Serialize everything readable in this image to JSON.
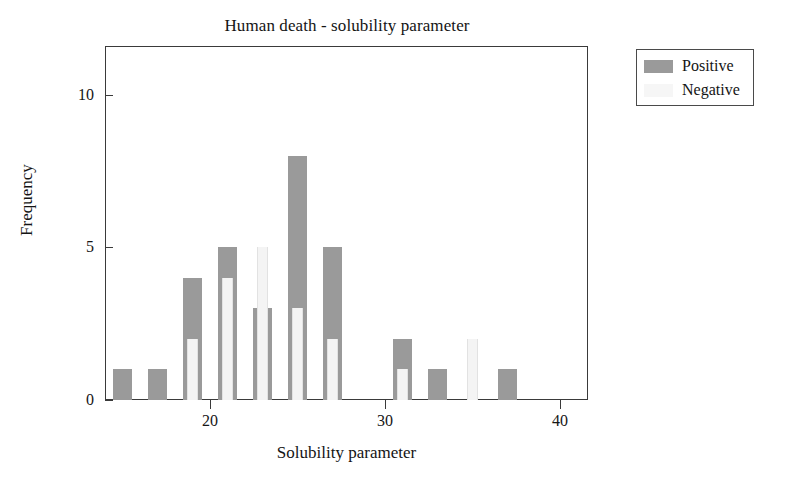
{
  "chart_data": {
    "type": "bar",
    "title": "Human death - solubility parameter",
    "xlabel": "Solubility parameter",
    "ylabel": "Frequency",
    "xlim": [
      14,
      41.6
    ],
    "ylim": [
      0,
      11.6
    ],
    "xticks": [
      20,
      30,
      40
    ],
    "xtick_labels": [
      "20",
      "30",
      "40"
    ],
    "yticks": [
      0,
      5,
      10
    ],
    "ytick_labels": [
      "0",
      "5",
      "10"
    ],
    "grid": false,
    "legend_position": "upper right outside",
    "bar_style": "overlapping",
    "categories": [
      15,
      17,
      19,
      21,
      23,
      25,
      27,
      31,
      33,
      35,
      37
    ],
    "series": [
      {
        "name": "Positive",
        "color": "#9a9a9a",
        "values": [
          1,
          1,
          4,
          5,
          3,
          8,
          5,
          2,
          1,
          0,
          1
        ]
      },
      {
        "name": "Negative",
        "color": "#f4f4f4",
        "values": [
          0,
          0,
          2,
          4,
          5,
          3,
          2,
          1,
          0,
          2,
          0
        ]
      }
    ]
  },
  "legend": {
    "entries": [
      {
        "label": "Positive",
        "swatch": "positive"
      },
      {
        "label": "Negative",
        "swatch": "negative"
      }
    ]
  },
  "colors": {
    "positive": "#9a9a9a",
    "negative": "#f4f4f4",
    "axis": "#3a3a3a",
    "text": "#141414",
    "background": "#ffffff"
  }
}
